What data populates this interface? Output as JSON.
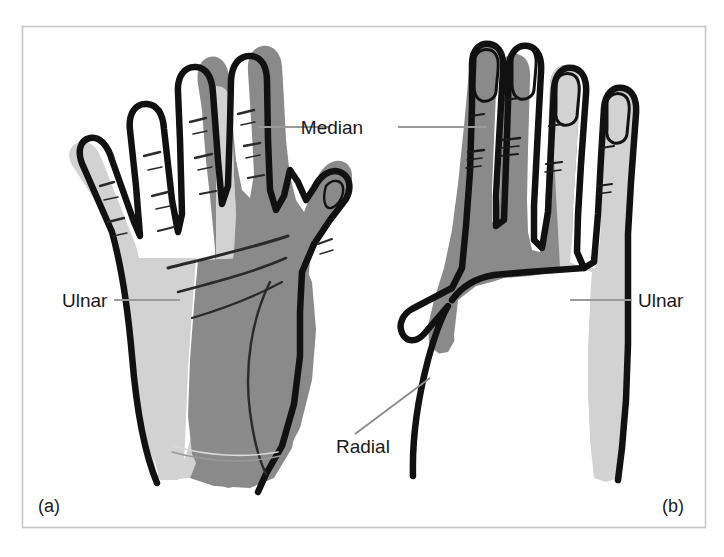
{
  "figure": {
    "background_color": "#ffffff",
    "frame_color": "#c8c8c8"
  },
  "colors": {
    "median_fill": "#8a8a8a",
    "ulnar_fill": "#d2d2d2",
    "radial_fill": "#ffffff",
    "outline": "#111111",
    "leader_line": "#9a9a9a",
    "crease_line": "#2a2a2a",
    "text": "#1a1a1a"
  },
  "labels": [
    {
      "id": "median",
      "text": "Median",
      "x": 363,
      "y": 127
    },
    {
      "id": "ulnar-left",
      "text": "Ulnar",
      "x": 62,
      "y": 305
    },
    {
      "id": "ulnar-right",
      "text": "Ulnar",
      "x": 638,
      "y": 305
    },
    {
      "id": "radial",
      "text": "Radial",
      "x": 336,
      "y": 447
    }
  ],
  "panels": [
    {
      "id": "a",
      "text": "(a)",
      "view": "palmar",
      "x": 38,
      "y": 512
    },
    {
      "id": "b",
      "text": "(b)",
      "view": "dorsal",
      "x": 662,
      "y": 512
    }
  ],
  "legend_note": {
    "median": "Median nerve territory shown in dark grey",
    "ulnar": "Ulnar nerve territory shown in light grey",
    "radial": "Radial nerve territory shown in white"
  }
}
